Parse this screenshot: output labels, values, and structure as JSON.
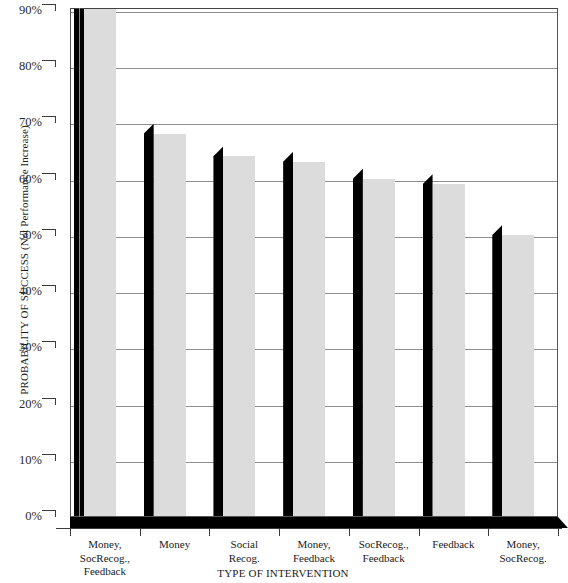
{
  "chart_data": {
    "type": "bar",
    "title": "",
    "xlabel": "TYPE OF INTERVENTION",
    "ylabel": "PROBABILITY OF SUCCESS (Not Performance Increase)",
    "ylim": [
      0,
      90
    ],
    "ytick_labels": [
      "90%",
      "80%",
      "70%",
      "60%",
      "50%",
      "40%",
      "30%",
      "20%",
      "10%",
      "0%"
    ],
    "ytick_values": [
      90,
      80,
      70,
      60,
      50,
      40,
      30,
      20,
      10,
      0
    ],
    "grid": true,
    "legend": "none",
    "style": "3d-bar",
    "bar_front_color": "#dcdcdc",
    "bar_side_color": "#000000",
    "gridline_color": "#8e8e8e",
    "categories": [
      "Money, SocRecog., Feedback",
      "Money",
      "Social Recog.",
      "Money, Feedback",
      "SocRecog., Feedback",
      "Feedback",
      "Money, SocRecog."
    ],
    "category_lines": [
      [
        "Money,",
        "SocRecog.,",
        "Feedback"
      ],
      [
        "Money"
      ],
      [
        "Social",
        "Recog."
      ],
      [
        "Money,",
        "Feedback"
      ],
      [
        "SocRecog.,",
        "Feedback"
      ],
      [
        "Feedback"
      ],
      [
        "Money,",
        "SocRecog."
      ]
    ],
    "values": [
      91,
      68,
      64,
      63,
      60,
      59,
      50
    ]
  }
}
